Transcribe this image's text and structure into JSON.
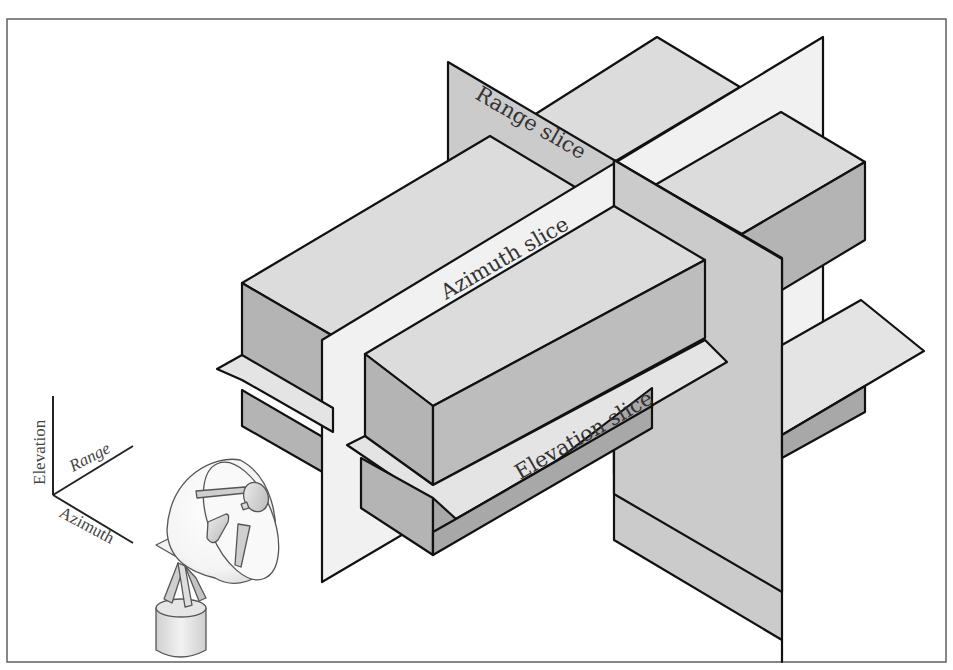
{
  "figure": {
    "slice_labels": {
      "range": "Range slice",
      "azimuth": "Azimuth slice",
      "elevation": "Elevation slice"
    },
    "axes": {
      "elevation": "Elevation",
      "range": "Range",
      "azimuth": "Azimuth"
    },
    "colors": {
      "frame": "#6a6a6a",
      "edge": "#111111",
      "top_face": "#dcdcdc",
      "side_face": "#b4b4b4",
      "side_face_dark": "#a6a6a6",
      "range_slice": "#cbcbcb",
      "azimuth_slice": "#f1f1f1",
      "elevation_slice": "#e4e4e4",
      "background": "#ffffff"
    },
    "icons": {
      "radar": "radar-dish-icon"
    }
  }
}
